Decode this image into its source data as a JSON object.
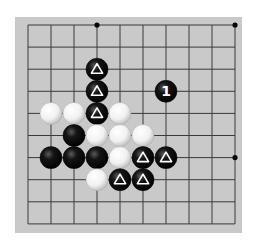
{
  "board": {
    "description": "Go problem diagram, partial board",
    "columns": 10,
    "rows": 10,
    "origin_px": [
      28,
      25
    ],
    "spacing_px": [
      23.0,
      22.1
    ],
    "board_rect_px": [
      15,
      17,
      227,
      216
    ],
    "colors": {
      "page": "#ffffff",
      "board": "#c9c9c9",
      "board_edge": "#b8b8b8",
      "line": "#3a3a3a",
      "black_stone": "#0a0a0a",
      "white_stone": "#f4f4f4",
      "marker_on_black": "#ffffff"
    },
    "hoshi": [
      [
        3,
        0
      ],
      [
        9,
        0
      ],
      [
        9,
        6
      ],
      [
        3,
        6
      ]
    ],
    "stones": [
      {
        "col": 3,
        "row": 2,
        "color": "black",
        "marker": "triangle"
      },
      {
        "col": 3,
        "row": 3,
        "color": "black",
        "marker": "triangle"
      },
      {
        "col": 6,
        "row": 3,
        "color": "black",
        "label": "1"
      },
      {
        "col": 1,
        "row": 4,
        "color": "white"
      },
      {
        "col": 2,
        "row": 4,
        "color": "white"
      },
      {
        "col": 3,
        "row": 4,
        "color": "black",
        "marker": "triangle"
      },
      {
        "col": 4,
        "row": 4,
        "color": "white"
      },
      {
        "col": 2,
        "row": 5,
        "color": "black"
      },
      {
        "col": 3,
        "row": 5,
        "color": "white"
      },
      {
        "col": 4,
        "row": 5,
        "color": "white"
      },
      {
        "col": 5,
        "row": 5,
        "color": "white"
      },
      {
        "col": 1,
        "row": 6,
        "color": "black"
      },
      {
        "col": 2,
        "row": 6,
        "color": "black"
      },
      {
        "col": 3,
        "row": 6,
        "color": "black"
      },
      {
        "col": 4,
        "row": 6,
        "color": "white"
      },
      {
        "col": 5,
        "row": 6,
        "color": "black",
        "marker": "triangle"
      },
      {
        "col": 6,
        "row": 6,
        "color": "black",
        "marker": "triangle"
      },
      {
        "col": 3,
        "row": 7,
        "color": "white"
      },
      {
        "col": 4,
        "row": 7,
        "color": "black",
        "marker": "triangle"
      },
      {
        "col": 5,
        "row": 7,
        "color": "black",
        "marker": "triangle"
      }
    ],
    "move_label": "1"
  }
}
